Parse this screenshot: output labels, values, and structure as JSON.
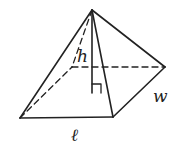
{
  "diagram": {
    "type": "rectangular pyramid",
    "labels": {
      "height": "h",
      "width": "w",
      "length": "ℓ"
    },
    "colors": {
      "stroke": "#222222",
      "background": "#ffffff"
    }
  }
}
